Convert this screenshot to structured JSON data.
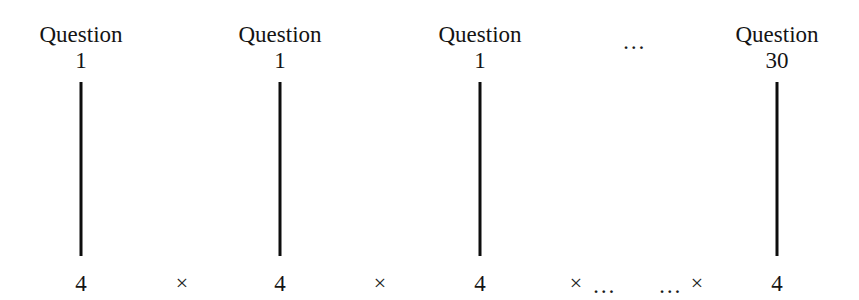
{
  "figure": {
    "background_color": "#ffffff",
    "ink_color": "#111111",
    "width": 859,
    "height": 300,
    "columns": [
      {
        "header_word": "Question",
        "header_number": "1",
        "term": "4",
        "center_x": 81
      },
      {
        "header_word": "Question",
        "header_number": "1",
        "term": "4",
        "center_x": 280
      },
      {
        "header_word": "Question",
        "header_number": "1",
        "term": "4",
        "center_x": 480
      },
      {
        "header_word": "Question",
        "header_number": "30",
        "term": "4",
        "center_x": 777
      }
    ],
    "header_ellipsis": {
      "text": "…",
      "center_x": 634,
      "center_y": 38
    },
    "stems": [
      {
        "center_x": 81,
        "top": 82,
        "height": 174
      },
      {
        "center_x": 280,
        "top": 82,
        "height": 174
      },
      {
        "center_x": 480,
        "top": 82,
        "height": 174
      },
      {
        "center_x": 777,
        "top": 82,
        "height": 174
      }
    ],
    "product_row": {
      "baseline_y": 272,
      "terms": [
        {
          "text": "4",
          "center_x": 81
        },
        {
          "text": "4",
          "center_x": 280
        },
        {
          "text": "4",
          "center_x": 480
        },
        {
          "text": "4",
          "center_x": 777
        }
      ],
      "operators": [
        {
          "text": "×",
          "center_x": 182
        },
        {
          "text": "×",
          "center_x": 380
        },
        {
          "text": "×",
          "center_x": 576
        },
        {
          "text": "×",
          "center_x": 697
        }
      ],
      "ellipses": [
        {
          "text": "…",
          "center_x": 604
        },
        {
          "text": "…",
          "center_x": 670
        }
      ]
    }
  }
}
